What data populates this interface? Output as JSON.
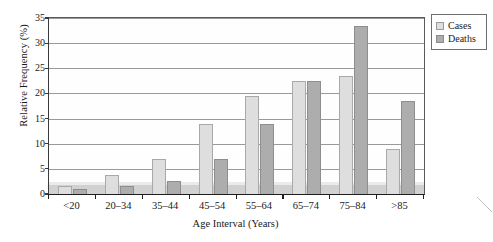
{
  "chart_data": {
    "type": "bar",
    "title": "",
    "xlabel": "Age Interval (Years)",
    "ylabel": "Relative Frequency (%)",
    "categories": [
      "<20",
      "20–34",
      "35–44",
      "45–54",
      "55–64",
      "65–74",
      "75–84",
      ">85"
    ],
    "series": [
      {
        "name": "Cases",
        "color": "#dedede",
        "values": [
          1.5,
          3.8,
          7.0,
          14.0,
          19.5,
          22.5,
          23.5,
          9.0
        ]
      },
      {
        "name": "Deaths",
        "color": "#adadad",
        "values": [
          1.0,
          1.5,
          2.5,
          7.0,
          14.0,
          22.5,
          33.5,
          18.5
        ]
      }
    ],
    "ylim": [
      0,
      35
    ],
    "yticks": [
      0,
      5,
      10,
      15,
      20,
      25,
      30,
      35
    ],
    "ytick_labels": [
      "0",
      "5",
      "10",
      "15",
      "20",
      "25",
      "30",
      "35"
    ],
    "grid": "horizontal",
    "legend_position": "outside-top-right"
  },
  "legend": {
    "items": [
      {
        "label": "Cases"
      },
      {
        "label": "Deaths"
      }
    ]
  },
  "axes": {
    "y_title": "Relative Frequency (%)",
    "x_title": "Age Interval (Years)"
  }
}
